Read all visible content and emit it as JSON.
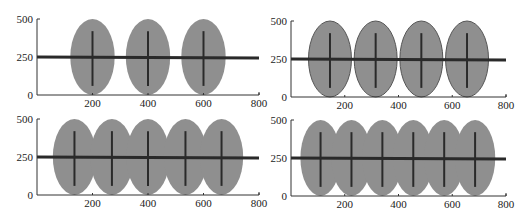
{
  "colors": {
    "ellipse_fill": "#8f8f8f",
    "ellipse_stroke_outlined": "#555555",
    "line": "#2a2a2a",
    "axis": "#333333",
    "background": "#ffffff"
  },
  "chart_data": [
    {
      "type": "scatter",
      "panel": "top-left",
      "title": "",
      "xlabel": "",
      "ylabel": "",
      "xlim": [
        0,
        800
      ],
      "ylim": [
        0,
        500
      ],
      "xticks": [
        "200",
        "400",
        "600",
        "800"
      ],
      "yticks": [
        "0",
        "250",
        "500"
      ],
      "grid": false,
      "outlined": false,
      "horizontal_line_y": 250,
      "ellipses": [
        {
          "cx": 200,
          "cy": 250,
          "rx": 80,
          "ry": 250
        },
        {
          "cx": 400,
          "cy": 250,
          "rx": 80,
          "ry": 250
        },
        {
          "cx": 600,
          "cy": 250,
          "rx": 80,
          "ry": 250
        }
      ],
      "vertical_bars": [
        {
          "x": 200,
          "y0": 60,
          "y1": 420
        },
        {
          "x": 400,
          "y0": 60,
          "y1": 420
        },
        {
          "x": 600,
          "y0": 60,
          "y1": 420
        }
      ]
    },
    {
      "type": "scatter",
      "panel": "top-right",
      "title": "",
      "xlabel": "",
      "ylabel": "",
      "xlim": [
        0,
        800
      ],
      "ylim": [
        0,
        500
      ],
      "xticks": [
        "200",
        "400",
        "600",
        "800"
      ],
      "yticks": [
        "0",
        "250",
        "500"
      ],
      "grid": false,
      "outlined": true,
      "horizontal_line_y": 250,
      "ellipses": [
        {
          "cx": 145,
          "cy": 250,
          "rx": 80,
          "ry": 250
        },
        {
          "cx": 315,
          "cy": 250,
          "rx": 80,
          "ry": 250
        },
        {
          "cx": 485,
          "cy": 250,
          "rx": 80,
          "ry": 250
        },
        {
          "cx": 655,
          "cy": 250,
          "rx": 80,
          "ry": 250
        }
      ],
      "vertical_bars": [
        {
          "x": 145,
          "y0": 60,
          "y1": 420
        },
        {
          "x": 315,
          "y0": 60,
          "y1": 420
        },
        {
          "x": 485,
          "y0": 60,
          "y1": 420
        },
        {
          "x": 655,
          "y0": 60,
          "y1": 420
        }
      ]
    },
    {
      "type": "scatter",
      "panel": "bottom-left",
      "title": "",
      "xlabel": "",
      "ylabel": "",
      "xlim": [
        0,
        800
      ],
      "ylim": [
        0,
        500
      ],
      "xticks": [
        "200",
        "400",
        "600",
        "800"
      ],
      "yticks": [
        "0",
        "250",
        "500"
      ],
      "grid": false,
      "outlined": false,
      "horizontal_line_y": 250,
      "ellipses": [
        {
          "cx": 135,
          "cy": 250,
          "rx": 78,
          "ry": 250
        },
        {
          "cx": 270,
          "cy": 250,
          "rx": 78,
          "ry": 250
        },
        {
          "cx": 400,
          "cy": 250,
          "rx": 78,
          "ry": 250
        },
        {
          "cx": 535,
          "cy": 250,
          "rx": 78,
          "ry": 250
        },
        {
          "cx": 665,
          "cy": 250,
          "rx": 78,
          "ry": 250
        }
      ],
      "vertical_bars": [
        {
          "x": 135,
          "y0": 60,
          "y1": 420
        },
        {
          "x": 270,
          "y0": 60,
          "y1": 420
        },
        {
          "x": 400,
          "y0": 60,
          "y1": 420
        },
        {
          "x": 535,
          "y0": 60,
          "y1": 420
        },
        {
          "x": 665,
          "y0": 60,
          "y1": 420
        }
      ]
    },
    {
      "type": "scatter",
      "panel": "bottom-right",
      "title": "",
      "xlabel": "",
      "ylabel": "",
      "xlim": [
        0,
        800
      ],
      "ylim": [
        0,
        500
      ],
      "xticks": [
        "200",
        "400",
        "600",
        "800"
      ],
      "yticks": [
        "0",
        "250",
        "500"
      ],
      "grid": false,
      "outlined": false,
      "horizontal_line_y": 250,
      "ellipses": [
        {
          "cx": 110,
          "cy": 250,
          "rx": 75,
          "ry": 250
        },
        {
          "cx": 225,
          "cy": 250,
          "rx": 75,
          "ry": 250
        },
        {
          "cx": 340,
          "cy": 250,
          "rx": 75,
          "ry": 250
        },
        {
          "cx": 455,
          "cy": 250,
          "rx": 75,
          "ry": 250
        },
        {
          "cx": 570,
          "cy": 250,
          "rx": 75,
          "ry": 250
        },
        {
          "cx": 685,
          "cy": 250,
          "rx": 75,
          "ry": 250
        }
      ],
      "vertical_bars": [
        {
          "x": 110,
          "y0": 60,
          "y1": 420
        },
        {
          "x": 225,
          "y0": 60,
          "y1": 420
        },
        {
          "x": 340,
          "y0": 60,
          "y1": 420
        },
        {
          "x": 455,
          "y0": 60,
          "y1": 420
        },
        {
          "x": 570,
          "y0": 60,
          "y1": 420
        },
        {
          "x": 685,
          "y0": 60,
          "y1": 420
        }
      ]
    }
  ],
  "layout": {
    "panels": [
      {
        "x0": 37,
        "x1": 259,
        "ytop": 19,
        "ybot": 95
      },
      {
        "x0": 291,
        "x1": 506,
        "ytop": 21,
        "ybot": 97
      },
      {
        "x0": 37,
        "x1": 259,
        "ytop": 119,
        "ybot": 195
      },
      {
        "x0": 291,
        "x1": 506,
        "ytop": 120,
        "ybot": 196
      }
    ]
  }
}
